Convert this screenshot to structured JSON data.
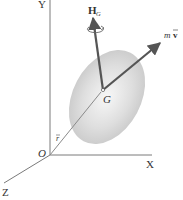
{
  "diagram": {
    "type": "rigid-body-momentum",
    "colors": {
      "axis": "#7a7a7a",
      "vector": "#555555",
      "body_center": "#ffffff",
      "body_edge": "#c4c4c4",
      "text": "#333333"
    },
    "axes": {
      "origin_label": "O",
      "x_label": "X",
      "y_label": "Y",
      "z_label": "Z"
    },
    "points": {
      "center_of_mass_label": "G"
    },
    "vectors": {
      "position": {
        "label": "r",
        "bar": true
      },
      "angular_momentum": {
        "label": "H",
        "subscript": "G"
      },
      "linear_momentum": {
        "label_m": "m",
        "label_v": "v",
        "bar": true
      }
    }
  }
}
